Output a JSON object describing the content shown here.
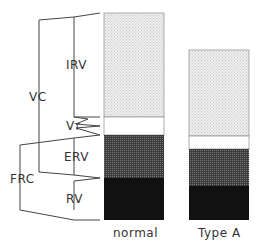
{
  "labels": {
    "irv": "IRV",
    "vc": "VC",
    "vt_main": "V",
    "vt_sub": "T",
    "erv": "ERV",
    "frc": "FRC",
    "rv": "RV"
  },
  "bars": [
    {
      "name": "normal",
      "label": "normal"
    },
    {
      "name": "type-a",
      "label": "Type A"
    }
  ],
  "colors": {
    "irv": "#e6e6e6",
    "vt": "#ffffff",
    "erv": "#555555",
    "rv": "#111111",
    "line": "#444444"
  }
}
